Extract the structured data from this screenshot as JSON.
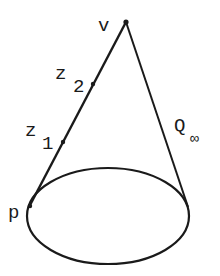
{
  "diagram": {
    "type": "cone",
    "colors": {
      "stroke": "#1a1a1a",
      "background": "#ffffff"
    },
    "vertex": {
      "label": "v",
      "x": 126,
      "y": 22
    },
    "points": [
      {
        "label": "z",
        "subscript": "2",
        "x": 93,
        "y": 84
      },
      {
        "label": "z",
        "subscript": "1",
        "x": 63,
        "y": 142
      },
      {
        "label": "p",
        "x": 30,
        "y": 205
      }
    ],
    "base_ellipse": {
      "cx": 108,
      "cy": 216,
      "rx": 81,
      "ry": 48
    },
    "right_generator_end": {
      "x": 188,
      "y": 207
    },
    "surface_label": {
      "label": "Q",
      "subscript": "∞"
    }
  }
}
